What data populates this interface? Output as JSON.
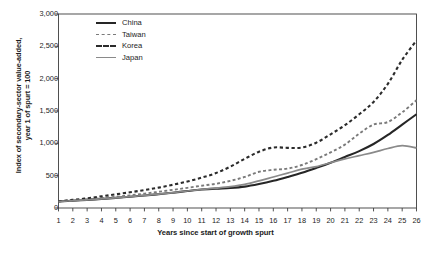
{
  "chart_data": {
    "type": "line",
    "title": "",
    "xlabel": "Years since start of growth spurt",
    "ylabel": "Index of secondary-sector value-added, year 1 of spurt = 100",
    "ylabel_line1": "Index of secondary-sector value-added,",
    "ylabel_line2": "year 1 of spurt = 100",
    "x": [
      1,
      2,
      3,
      4,
      5,
      6,
      7,
      8,
      9,
      10,
      11,
      12,
      13,
      14,
      15,
      16,
      17,
      18,
      19,
      20,
      21,
      22,
      23,
      24,
      25,
      26
    ],
    "xtick_labels": [
      "1",
      "2",
      "3",
      "4",
      "5",
      "6",
      "7",
      "8",
      "9",
      "10",
      "11",
      "12",
      "13",
      "14",
      "15",
      "16",
      "17",
      "18",
      "19",
      "20",
      "21",
      "22",
      "23",
      "24",
      "25",
      "26"
    ],
    "ytick_labels": [
      "0",
      "500",
      "1,000",
      "1,500",
      "2,000",
      "2,500",
      "3,000"
    ],
    "ytick_values": [
      0,
      500,
      1000,
      1500,
      2000,
      2500,
      3000
    ],
    "ylim": [
      0,
      3000
    ],
    "xlim": [
      1,
      26
    ],
    "grid": false,
    "legend_position": "top-left-inside",
    "series": [
      {
        "name": "China",
        "style": "solid",
        "color": "#262626",
        "width": 2.1,
        "values": [
          100,
          112,
          125,
          140,
          157,
          175,
          193,
          213,
          237,
          262,
          285,
          300,
          310,
          330,
          370,
          420,
          480,
          545,
          620,
          700,
          790,
          880,
          990,
          1130,
          1290,
          1450
        ]
      },
      {
        "name": "Taiwan",
        "style": "dashed",
        "color": "#7a7a7a",
        "width": 1.9,
        "values": [
          100,
          116,
          133,
          152,
          172,
          196,
          222,
          250,
          281,
          312,
          345,
          375,
          420,
          480,
          560,
          590,
          610,
          665,
          755,
          860,
          980,
          1150,
          1290,
          1330,
          1480,
          1665
        ]
      },
      {
        "name": "Korea",
        "style": "dashed",
        "color": "#2b2b2b",
        "width": 2.1,
        "values": [
          105,
          125,
          150,
          180,
          212,
          243,
          278,
          315,
          360,
          410,
          470,
          540,
          640,
          760,
          870,
          935,
          930,
          935,
          1010,
          1140,
          1280,
          1450,
          1640,
          1920,
          2290,
          2590
        ]
      },
      {
        "name": "Japan",
        "style": "solid",
        "color": "#8a8a8a",
        "width": 1.7,
        "values": [
          100,
          113,
          127,
          142,
          158,
          176,
          194,
          214,
          238,
          263,
          288,
          307,
          330,
          365,
          420,
          480,
          540,
          600,
          640,
          700,
          760,
          810,
          860,
          920,
          965,
          930
        ]
      }
    ]
  },
  "legend": {
    "items": [
      {
        "label": "China",
        "swatch": "sw-solid-dark"
      },
      {
        "label": "Taiwan",
        "swatch": "sw-dash-light"
      },
      {
        "label": "Korea",
        "swatch": "sw-dash-dark"
      },
      {
        "label": "Japan",
        "swatch": "sw-solid-gray"
      }
    ]
  },
  "caption": ""
}
